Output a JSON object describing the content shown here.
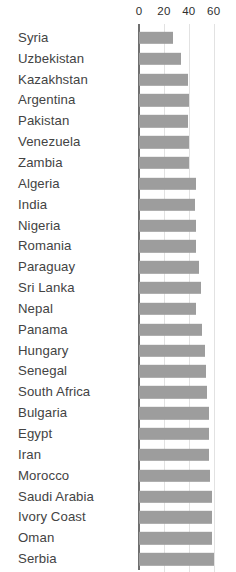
{
  "chart_data": {
    "type": "bar",
    "orientation": "horizontal",
    "title": "",
    "subtitle": "",
    "xlabel": "",
    "ylabel": "",
    "xlim": [
      0,
      65
    ],
    "xticks": [
      0,
      20,
      40,
      60
    ],
    "xtick_labels": [
      "0",
      "20",
      "40",
      "60"
    ],
    "grid": true,
    "grid_axis": "x",
    "legend": false,
    "legend_position": "none",
    "bar_color": "#9d9d9d",
    "axis_color": "#6f6f6f",
    "gridline_color": "#e2e2e2",
    "background_color": "#ffffff",
    "label_color": "#434343",
    "categories": [
      "Syria",
      "Uzbekistan",
      "Kazakhstan",
      "Argentina",
      "Pakistan",
      "Venezuela",
      "Zambia",
      "Algeria",
      "India",
      "Nigeria",
      "Romania",
      "Paraguay",
      "Sri Lanka",
      "Nepal",
      "Panama",
      "Hungary",
      "Senegal",
      "South Africa",
      "Bulgaria",
      "Egypt",
      "Iran",
      "Morocco",
      "Saudi Arabia",
      "Ivory Coast",
      "Oman",
      "Serbia"
    ],
    "values": [
      27,
      34,
      39,
      40,
      39,
      40,
      40,
      46,
      45,
      46,
      46,
      48,
      50,
      46,
      51,
      53,
      54,
      55,
      56,
      56,
      56,
      57,
      59,
      59,
      59,
      60
    ]
  }
}
